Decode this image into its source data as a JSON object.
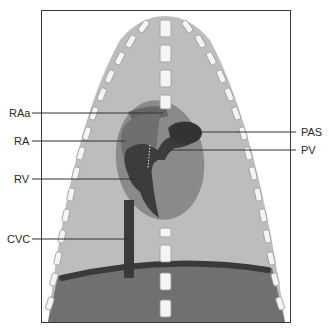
{
  "diagram": {
    "type": "anatomical-schematic",
    "colors": {
      "background": "#ffffff",
      "frame": "#3a3a3a",
      "thorax": "#bdbdbd",
      "heart": "#8a8a8a",
      "chambers": "#3c3c3c",
      "abdomen": "#707070",
      "diaphragm": "#3a3a3a",
      "rib": "#f4f4f4",
      "leader": "#333333"
    },
    "labels": {
      "left": [
        {
          "id": "RAa",
          "text": "RAa"
        },
        {
          "id": "RA",
          "text": "RA"
        },
        {
          "id": "RV",
          "text": "RV"
        },
        {
          "id": "CVC",
          "text": "CVC"
        }
      ],
      "right": [
        {
          "id": "PAS",
          "text": "PAS"
        },
        {
          "id": "PV",
          "text": "PV"
        }
      ]
    }
  }
}
